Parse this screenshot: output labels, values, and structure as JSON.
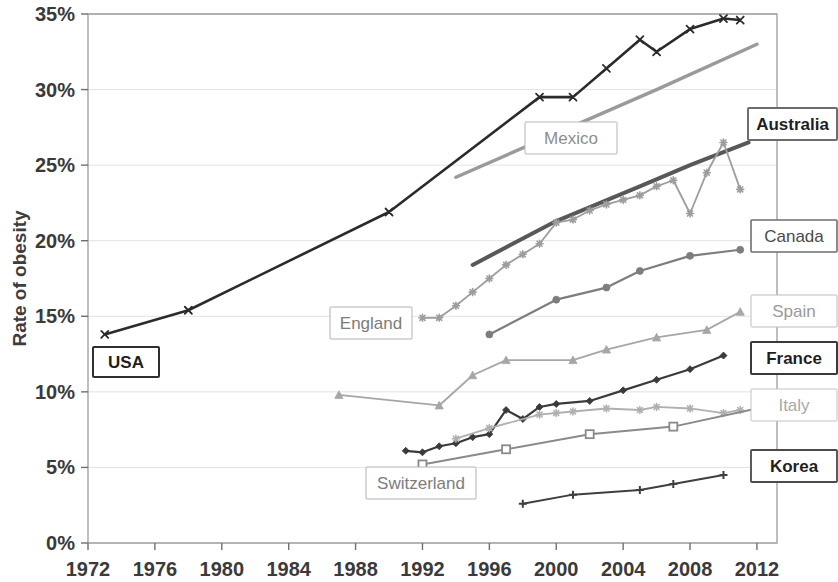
{
  "chart_data": {
    "type": "line",
    "title": "",
    "xlabel": "",
    "ylabel": "Rate of obesity",
    "xlim": [
      1972,
      2013.2
    ],
    "ylim": [
      0,
      35
    ],
    "grid": true,
    "grid_axis": "y",
    "legend_position": "inline-callouts",
    "y_tick_labels": [
      "0%",
      "5%",
      "10%",
      "15%",
      "20%",
      "25%",
      "30%",
      "35%"
    ],
    "y_tick_values": [
      0,
      5,
      10,
      15,
      20,
      25,
      30,
      35
    ],
    "x_tick_labels": [
      "1972",
      "1976",
      "1980",
      "1984",
      "1988",
      "1992",
      "1996",
      "2000",
      "2004",
      "2008",
      "2012"
    ],
    "x_tick_values": [
      1972,
      1976,
      1980,
      1984,
      1988,
      1992,
      1996,
      2000,
      2004,
      2008,
      2012
    ],
    "series": [
      {
        "name": "USA",
        "color": "#2b2b2b",
        "width": 2.6,
        "marker": "x",
        "marker_size": 7,
        "label_style": "bold",
        "x": [
          1973,
          1978,
          1990,
          1999,
          2001,
          2003,
          2005,
          2006,
          2008,
          2010,
          2011
        ],
        "values": [
          13.8,
          15.4,
          21.9,
          29.5,
          29.5,
          31.4,
          33.3,
          32.5,
          34.0,
          34.7,
          34.6
        ]
      },
      {
        "name": "Mexico",
        "color": "#9a9a9a",
        "width": 3.4,
        "marker": "none",
        "marker_size": 0,
        "label_style": "light",
        "x": [
          1994,
          2006,
          2012
        ],
        "values": [
          24.2,
          30.0,
          33.0
        ]
      },
      {
        "name": "Australia",
        "color": "#585858",
        "width": 4.0,
        "marker": "none",
        "marker_size": 0,
        "label_style": "bold",
        "x": [
          1995,
          2000,
          2005,
          2008,
          2011.5
        ],
        "values": [
          18.4,
          21.3,
          23.6,
          25.0,
          26.5
        ]
      },
      {
        "name": "England",
        "color": "#9d9d9d",
        "width": 1.8,
        "marker": "star",
        "marker_size": 7,
        "label_style": "light",
        "x": [
          1992,
          1993,
          1994,
          1995,
          1996,
          1997,
          1998,
          1999,
          2000,
          2001,
          2002,
          2003,
          2004,
          2005,
          2006,
          2007,
          2008,
          2009,
          2010,
          2011
        ],
        "values": [
          14.9,
          14.9,
          15.7,
          16.6,
          17.5,
          18.4,
          19.1,
          19.8,
          21.2,
          21.4,
          22.0,
          22.4,
          22.7,
          23.0,
          23.6,
          24.0,
          21.8,
          24.5,
          26.5,
          23.4
        ]
      },
      {
        "name": "Canada",
        "color": "#7d7d7d",
        "width": 2.2,
        "marker": "circle",
        "marker_size": 7,
        "label_style": "normal",
        "x": [
          1996,
          2000,
          2003,
          2005,
          2008,
          2011
        ],
        "values": [
          13.8,
          16.1,
          16.9,
          18.0,
          19.0,
          19.4
        ]
      },
      {
        "name": "Spain",
        "color": "#a6a6a6",
        "width": 1.8,
        "marker": "triangle",
        "marker_size": 7,
        "label_style": "light",
        "x": [
          1987,
          1993,
          1995,
          1997,
          2001,
          2003,
          2006,
          2009,
          2011
        ],
        "values": [
          9.8,
          9.1,
          11.1,
          12.1,
          12.1,
          12.8,
          13.6,
          14.1,
          15.3
        ]
      },
      {
        "name": "France",
        "color": "#3a3a3a",
        "width": 2.2,
        "marker": "diamond",
        "marker_size": 7,
        "label_style": "bold",
        "x": [
          1991,
          1992,
          1993,
          1994,
          1995,
          1996,
          1997,
          1998,
          1999,
          2000,
          2002,
          2004,
          2006,
          2008,
          2010
        ],
        "values": [
          6.1,
          6.0,
          6.4,
          6.6,
          7.0,
          7.2,
          8.8,
          8.2,
          9.0,
          9.2,
          9.4,
          10.1,
          10.8,
          11.5,
          12.4
        ]
      },
      {
        "name": "Italy",
        "color": "#b0b0b0",
        "width": 1.8,
        "marker": "star",
        "marker_size": 7,
        "label_style": "light",
        "x": [
          1994,
          1996,
          1999,
          2000,
          2001,
          2003,
          2005,
          2006,
          2008,
          2010,
          2011
        ],
        "values": [
          6.9,
          7.6,
          8.5,
          8.6,
          8.7,
          8.9,
          8.8,
          9.0,
          8.9,
          8.6,
          8.8
        ]
      },
      {
        "name": "Switzerland",
        "color": "#8a8a8a",
        "width": 2.0,
        "marker": "square",
        "marker_size": 8,
        "label_style": "light",
        "x": [
          1992,
          1997,
          2002,
          2007,
          2012
        ],
        "values": [
          5.2,
          6.2,
          7.2,
          7.7,
          8.9
        ]
      },
      {
        "name": "Korea",
        "color": "#3f3f3f",
        "width": 2.0,
        "marker": "plus",
        "marker_size": 8,
        "label_style": "bold",
        "x": [
          1998,
          2001,
          2005,
          2007,
          2010
        ],
        "values": [
          2.6,
          3.2,
          3.5,
          3.9,
          4.5
        ]
      }
    ],
    "callouts": [
      {
        "label": "USA",
        "x": 93,
        "y": 347,
        "w": 66,
        "h": 30,
        "style": "bold",
        "text_color": "#1f1f1f",
        "border_color": "#2f2f2f",
        "border_width": 2
      },
      {
        "label": "Mexico",
        "x": 525,
        "y": 122,
        "w": 92,
        "h": 32,
        "style": "light",
        "text_color": "#8e8e8e",
        "border_color": "#b6b6b6",
        "border_width": 1
      },
      {
        "label": "Australia",
        "x": 749,
        "y": 108,
        "w": 89,
        "h": 32,
        "style": "bold",
        "text_color": "#1f1f1f",
        "border_color": "#6d6d6d",
        "border_width": 2
      },
      {
        "label": "England",
        "x": 330,
        "y": 307,
        "w": 82,
        "h": 32,
        "style": "normal",
        "text_color": "#7b7b7b",
        "border_color": "#b2b2b2",
        "border_width": 1
      },
      {
        "label": "Canada",
        "x": 752,
        "y": 220,
        "w": 86,
        "h": 32,
        "style": "normal",
        "text_color": "#4b4b4b",
        "border_color": "#6f6f6f",
        "border_width": 1.6
      },
      {
        "label": "Spain",
        "x": 752,
        "y": 295,
        "w": 86,
        "h": 32,
        "style": "light",
        "text_color": "#9a9a9a",
        "border_color": "#bdbdbd",
        "border_width": 1
      },
      {
        "label": "France",
        "x": 752,
        "y": 342,
        "w": 86,
        "h": 32,
        "style": "bold",
        "text_color": "#1f1f1f",
        "border_color": "#3a3a3a",
        "border_width": 2
      },
      {
        "label": "Italy",
        "x": 752,
        "y": 389,
        "w": 86,
        "h": 32,
        "style": "light",
        "text_color": "#a8a8a8",
        "border_color": "#c2c2c2",
        "border_width": 1
      },
      {
        "label": "Korea",
        "x": 752,
        "y": 450,
        "w": 86,
        "h": 32,
        "style": "bold",
        "text_color": "#1f1f1f",
        "border_color": "#4a4a4a",
        "border_width": 1.8
      },
      {
        "label": "Switzerland",
        "x": 366,
        "y": 467,
        "w": 110,
        "h": 32,
        "style": "light",
        "text_color": "#7d7d7d",
        "border_color": "#b2b2b2",
        "border_width": 1
      }
    ]
  },
  "axes": {
    "plot_left": 88,
    "plot_right": 777,
    "plot_top": 14,
    "plot_bottom": 543,
    "axis_color": "#9c9c9c",
    "grid_color": "#e3e3e3"
  }
}
